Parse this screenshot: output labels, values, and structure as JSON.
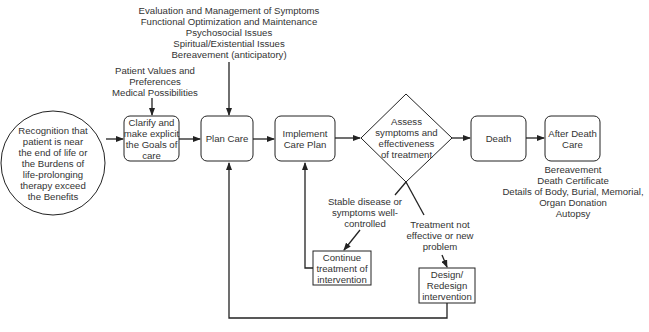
{
  "diagram": {
    "start": {
      "lines": [
        "Recognition that",
        "patient is near",
        "the end of life or",
        "the Burdens of",
        "life-prolonging",
        "therapy exceed",
        "the Benefits"
      ]
    },
    "inputs_goals": {
      "lines": [
        "Patient Values and",
        "Preferences",
        "Medical Possibilities"
      ]
    },
    "inputs_plan": {
      "lines": [
        "Evaluation and Management of Symptoms",
        "Functional Optimization and Maintenance",
        "Psychosocial Issues",
        "Spiritual/Existential Issues",
        "Bereavement (anticipatory)"
      ]
    },
    "clarify": {
      "lines": [
        "Clarify and",
        "make explicit",
        "the Goals of",
        "care"
      ]
    },
    "plan_care": {
      "lines": [
        "Plan Care"
      ]
    },
    "implement": {
      "lines": [
        "Implement",
        "Care Plan"
      ]
    },
    "assess": {
      "lines": [
        "Assess",
        "symptoms and",
        "effectiveness",
        "of treatment"
      ]
    },
    "death": {
      "lines": [
        "Death"
      ]
    },
    "after_death": {
      "lines": [
        "After Death",
        "Care"
      ]
    },
    "after_death_notes": {
      "lines": [
        "Bereavement",
        "Death Certificate",
        "Details of Body, Burial, Memorial,",
        "Organ Donation",
        "Autopsy"
      ]
    },
    "stable_label": {
      "lines": [
        "Stable disease or",
        "symptoms well-",
        "controlled"
      ]
    },
    "not_effective_label": {
      "lines": [
        "Treatment not",
        "effective or new",
        "problem"
      ]
    },
    "continue": {
      "lines": [
        "Continue",
        "treatment of",
        "intervention"
      ]
    },
    "redesign": {
      "lines": [
        "Design/",
        "Redesign",
        "intervention"
      ]
    }
  }
}
